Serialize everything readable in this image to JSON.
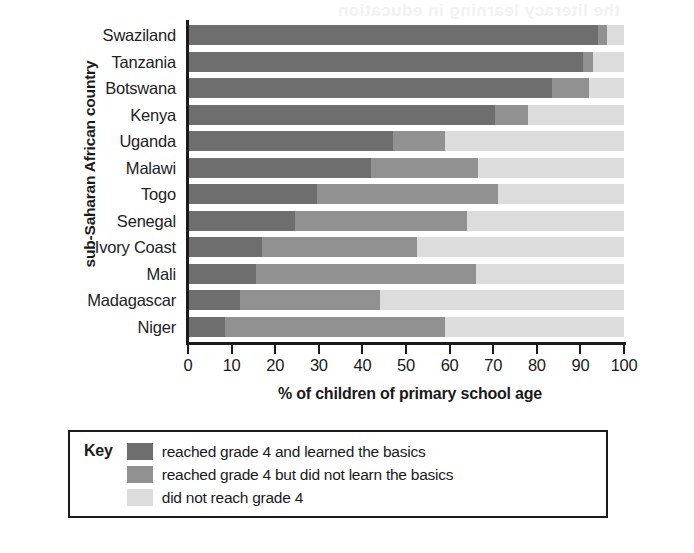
{
  "ghost": {
    "text": "the literacy learning in education"
  },
  "chart_data": {
    "type": "bar",
    "orientation": "horizontal",
    "stacked": true,
    "title": "",
    "xlabel": "% of children of primary school age",
    "ylabel": "sub-Saharan African country",
    "xlim": [
      0,
      100
    ],
    "grid": false,
    "legend_position": "bottom",
    "legend_title": "Key",
    "categories": [
      "Swaziland",
      "Tanzania",
      "Botswana",
      "Kenya",
      "Uganda",
      "Malawi",
      "Togo",
      "Senegal",
      "Ivory Coast",
      "Mali",
      "Madagascar",
      "Niger"
    ],
    "xticks": [
      0,
      10,
      20,
      30,
      40,
      50,
      60,
      70,
      80,
      90,
      100
    ],
    "series": [
      {
        "name": "reached grade 4 and learned the basics",
        "color": "#6e6e6e",
        "values": [
          94,
          90.5,
          83.5,
          70.5,
          47,
          42,
          29.5,
          24.5,
          17,
          15.5,
          12,
          8.5
        ]
      },
      {
        "name": "reached grade 4 but did not learn the basics",
        "color": "#919191",
        "values": [
          2,
          2.5,
          8.5,
          7.5,
          12,
          24.5,
          41.5,
          39.5,
          35.5,
          50.5,
          32,
          50.5
        ]
      },
      {
        "name": "did not reach grade 4",
        "color": "#dcdcdc",
        "values": [
          4,
          7,
          8,
          22,
          41,
          33.5,
          29,
          36,
          47.5,
          34,
          56,
          41
        ]
      }
    ]
  },
  "legend": {
    "title": "Key",
    "items": [
      {
        "color": "#6e6e6e",
        "label": "reached grade 4 and learned the basics"
      },
      {
        "color": "#919191",
        "label": "reached grade 4 but did not learn the basics"
      },
      {
        "color": "#dcdcdc",
        "label": "did not reach grade 4"
      }
    ]
  }
}
